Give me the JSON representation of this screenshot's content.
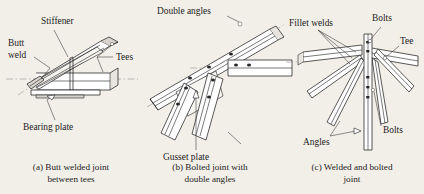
{
  "figure": {
    "background_color": "#f2efe9",
    "ink_color": "#232221",
    "panels": [
      {
        "id": "a",
        "caption_line1": "(a) Butt welded joint",
        "caption_line2": "between tees",
        "labels": [
          {
            "name": "stiffener",
            "text": "Stiffener"
          },
          {
            "name": "butt-weld-line1",
            "text": "Butt"
          },
          {
            "name": "butt-weld-line2",
            "text": "weld"
          },
          {
            "name": "tees",
            "text": "Tees"
          },
          {
            "name": "bearing-plate",
            "text": "Bearing plate"
          }
        ]
      },
      {
        "id": "b",
        "caption_line1": "(b) Bolted joint with",
        "caption_line2": "double angles",
        "labels": [
          {
            "name": "double-angles",
            "text": "Double angles"
          },
          {
            "name": "gusset-plate",
            "text": "Gusset plate"
          }
        ]
      },
      {
        "id": "c",
        "caption_line1": "(c) Welded and bolted",
        "caption_line2": "joint",
        "labels": [
          {
            "name": "fillet-welds",
            "text": "Fillet welds"
          },
          {
            "name": "bolts-top",
            "text": "Bolts"
          },
          {
            "name": "tee",
            "text": "Tee"
          },
          {
            "name": "bolts-bottom",
            "text": "Bolts"
          },
          {
            "name": "angles",
            "text": "Angles"
          }
        ]
      }
    ]
  }
}
